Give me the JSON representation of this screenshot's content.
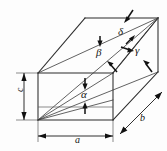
{
  "figure": {
    "name": "cuboid-space-diagonal-angles",
    "background_color": "#fdfdfd",
    "line_color": "#2b2b2b",
    "angle_labels": [
      {
        "id": "alpha",
        "symbol": "α",
        "kind": "angle"
      },
      {
        "id": "beta",
        "symbol": "β",
        "kind": "angle"
      },
      {
        "id": "gamma",
        "symbol": "γ",
        "kind": "angle"
      },
      {
        "id": "delta",
        "symbol": "δ",
        "kind": "angle"
      }
    ],
    "dimension_labels": [
      {
        "id": "a",
        "symbol": "a",
        "kind": "dimension",
        "orientation": "horizontal",
        "position": "bottom-front"
      },
      {
        "id": "b",
        "symbol": "b",
        "kind": "dimension",
        "orientation": "diagonal",
        "position": "bottom-right"
      },
      {
        "id": "c",
        "symbol": "c",
        "kind": "dimension",
        "orientation": "vertical",
        "position": "left"
      }
    ]
  }
}
